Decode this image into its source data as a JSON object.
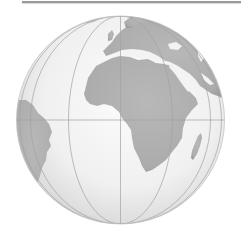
{
  "map": {
    "type": "orthographic-globe",
    "view": {
      "center_lon": 0,
      "center_lat": 0
    },
    "visible_landmasses": [
      "Africa",
      "Europe",
      "Arabian Peninsula",
      "Middle East",
      "South America (east coast)",
      "Madagascar",
      "Greenland/Iceland fringe"
    ],
    "graticule": {
      "equator": true,
      "prime_meridian": true,
      "meridians_visible": 7
    },
    "colors": {
      "land": "#b3b3b3",
      "land_edge": "#a8a8a8",
      "ocean_light": "#fafafa",
      "ocean_dark": "#cfcfcf",
      "graticule": "#9e9e9e",
      "top_bar": "#9a9a9a"
    }
  }
}
